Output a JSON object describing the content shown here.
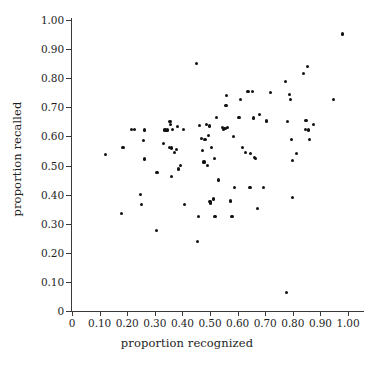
{
  "figure": {
    "background_color": "#ffffff",
    "point_color": "#111111",
    "axis_color": "#3a3a3a"
  },
  "chart_data": {
    "type": "scatter",
    "title": "",
    "subtitle": "",
    "xlabel": "proportion recognized",
    "ylabel": "proportion recalled",
    "xlim": [
      0,
      1.0
    ],
    "ylim": [
      0,
      1.0
    ],
    "grid": false,
    "legend": null,
    "legend_position": "none",
    "xticks": [
      0,
      0.1,
      0.2,
      0.3,
      0.4,
      0.5,
      0.6,
      0.7,
      0.8,
      0.9,
      1.0
    ],
    "xtick_labels": [
      "0",
      "0.10",
      "0.20",
      "0.30",
      "0.40",
      "0.50",
      "0.60",
      "0.70",
      "0.80",
      "0.90",
      "1.00"
    ],
    "yticks": [
      0,
      0.1,
      0.2,
      0.3,
      0.4,
      0.5,
      0.6,
      0.7,
      0.8,
      0.9,
      1.0
    ],
    "ytick_labels": [
      "0",
      "0.10",
      "0.20",
      "0.30",
      "0.40",
      "0.50",
      "0.60",
      "0.70",
      "0.80",
      "0.90",
      "1.00"
    ],
    "marker": "filled-circle",
    "marker_size": 3,
    "n_points": 103,
    "points": [
      [
        0.12,
        0.537
      ],
      [
        0.18,
        0.336
      ],
      [
        0.185,
        0.562
      ],
      [
        0.215,
        0.625
      ],
      [
        0.225,
        0.623
      ],
      [
        0.247,
        0.4
      ],
      [
        0.252,
        0.365
      ],
      [
        0.258,
        0.585
      ],
      [
        0.262,
        0.622
      ],
      [
        0.263,
        0.522
      ],
      [
        0.305,
        0.277
      ],
      [
        0.308,
        0.475
      ],
      [
        0.332,
        0.575
      ],
      [
        0.337,
        0.622
      ],
      [
        0.341,
        0.62
      ],
      [
        0.345,
        0.622
      ],
      [
        0.352,
        0.563
      ],
      [
        0.355,
        0.652
      ],
      [
        0.357,
        0.642
      ],
      [
        0.36,
        0.463
      ],
      [
        0.362,
        0.56
      ],
      [
        0.365,
        0.625
      ],
      [
        0.372,
        0.545
      ],
      [
        0.378,
        0.556
      ],
      [
        0.383,
        0.635
      ],
      [
        0.386,
        0.488
      ],
      [
        0.392,
        0.5
      ],
      [
        0.405,
        0.624
      ],
      [
        0.408,
        0.365
      ],
      [
        0.452,
        0.85
      ],
      [
        0.455,
        0.24
      ],
      [
        0.458,
        0.325
      ],
      [
        0.462,
        0.637
      ],
      [
        0.468,
        0.592
      ],
      [
        0.472,
        0.551
      ],
      [
        0.478,
        0.512
      ],
      [
        0.482,
        0.588
      ],
      [
        0.486,
        0.64
      ],
      [
        0.49,
        0.5
      ],
      [
        0.494,
        0.603
      ],
      [
        0.498,
        0.636
      ],
      [
        0.5,
        0.377
      ],
      [
        0.503,
        0.371
      ],
      [
        0.505,
        0.563
      ],
      [
        0.512,
        0.386
      ],
      [
        0.514,
        0.383
      ],
      [
        0.516,
        0.524
      ],
      [
        0.518,
        0.326
      ],
      [
        0.525,
        0.665
      ],
      [
        0.532,
        0.45
      ],
      [
        0.545,
        0.63
      ],
      [
        0.55,
        0.625
      ],
      [
        0.553,
        0.626
      ],
      [
        0.556,
        0.628
      ],
      [
        0.558,
        0.705
      ],
      [
        0.56,
        0.74
      ],
      [
        0.562,
        0.631
      ],
      [
        0.575,
        0.378
      ],
      [
        0.58,
        0.326
      ],
      [
        0.585,
        0.601
      ],
      [
        0.59,
        0.425
      ],
      [
        0.605,
        0.664
      ],
      [
        0.612,
        0.727
      ],
      [
        0.618,
        0.563
      ],
      [
        0.628,
        0.546
      ],
      [
        0.638,
        0.755
      ],
      [
        0.645,
        0.424
      ],
      [
        0.648,
        0.54
      ],
      [
        0.655,
        0.755
      ],
      [
        0.658,
        0.663
      ],
      [
        0.662,
        0.527
      ],
      [
        0.665,
        0.525
      ],
      [
        0.672,
        0.352
      ],
      [
        0.678,
        0.676
      ],
      [
        0.695,
        0.425
      ],
      [
        0.705,
        0.653
      ],
      [
        0.718,
        0.75
      ],
      [
        0.775,
        0.79
      ],
      [
        0.778,
        0.063
      ],
      [
        0.782,
        0.652
      ],
      [
        0.788,
        0.745
      ],
      [
        0.792,
        0.727
      ],
      [
        0.795,
        0.59
      ],
      [
        0.798,
        0.517
      ],
      [
        0.8,
        0.391
      ],
      [
        0.812,
        0.54
      ],
      [
        0.838,
        0.815
      ],
      [
        0.845,
        0.625
      ],
      [
        0.848,
        0.655
      ],
      [
        0.852,
        0.84
      ],
      [
        0.858,
        0.622
      ],
      [
        0.862,
        0.59
      ],
      [
        0.875,
        0.64
      ],
      [
        0.948,
        0.727
      ],
      [
        0.98,
        0.952
      ]
    ]
  }
}
